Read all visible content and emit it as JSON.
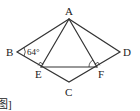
{
  "diagram": {
    "type": "geometry",
    "shape": "rhombus ABCD with inscribed triangle AEF",
    "points": {
      "A": {
        "label": "A",
        "x": 69,
        "y": 19
      },
      "B": {
        "label": "B",
        "x": 17,
        "y": 52
      },
      "C": {
        "label": "C",
        "x": 69,
        "y": 82
      },
      "D": {
        "label": "D",
        "x": 120,
        "y": 52
      },
      "E": {
        "label": "E",
        "x": 41,
        "y": 67
      },
      "F": {
        "label": "F",
        "x": 97,
        "y": 67
      }
    },
    "segments": [
      "AB",
      "BC",
      "CD",
      "DA",
      "AE",
      "AF",
      "EF"
    ],
    "angle_annotations": [
      {
        "vertex": "B",
        "value": "64°"
      },
      {
        "vertex": "E",
        "type": "right-angle",
        "between": [
          "AE",
          "BC"
        ]
      },
      {
        "vertex": "F",
        "type": "right-angle",
        "between": [
          "AF",
          "CD"
        ]
      },
      {
        "vertex": "F",
        "type": "arc",
        "between": [
          "FE",
          "FA"
        ]
      }
    ],
    "caption_fragment": "图]"
  }
}
